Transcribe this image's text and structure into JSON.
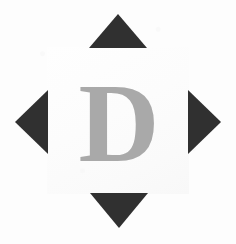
{
  "scene": {
    "name": "letter-card",
    "width": 236,
    "height": 244,
    "background_color": "#fdfdfd",
    "description": "Scanned white card showing a gray serif capital letter surrounded by four dark triangular registration marks"
  },
  "panel": {
    "label": "letter-panel",
    "color": "#fbfbfb",
    "x": 47,
    "y": 47,
    "width": 142,
    "height": 147
  },
  "glyph": {
    "character": "D",
    "color": "#a9a9a9",
    "style": "serif-bold",
    "size_px": 112
  },
  "marks": {
    "color": "#303030",
    "count": 4,
    "items": [
      {
        "name": "triangle-up",
        "direction": "up",
        "icon": "triangle-up-icon",
        "x": 89,
        "y": 14,
        "width": 58,
        "height": 34
      },
      {
        "name": "triangle-right",
        "direction": "right",
        "icon": "triangle-right-icon",
        "x": 188,
        "y": 90,
        "width": 33,
        "height": 64
      },
      {
        "name": "triangle-down",
        "direction": "down",
        "icon": "triangle-down-icon",
        "x": 90,
        "y": 193,
        "width": 58,
        "height": 35
      },
      {
        "name": "triangle-left",
        "direction": "left",
        "icon": "triangle-left-icon",
        "x": 15,
        "y": 90,
        "width": 33,
        "height": 64
      }
    ]
  }
}
